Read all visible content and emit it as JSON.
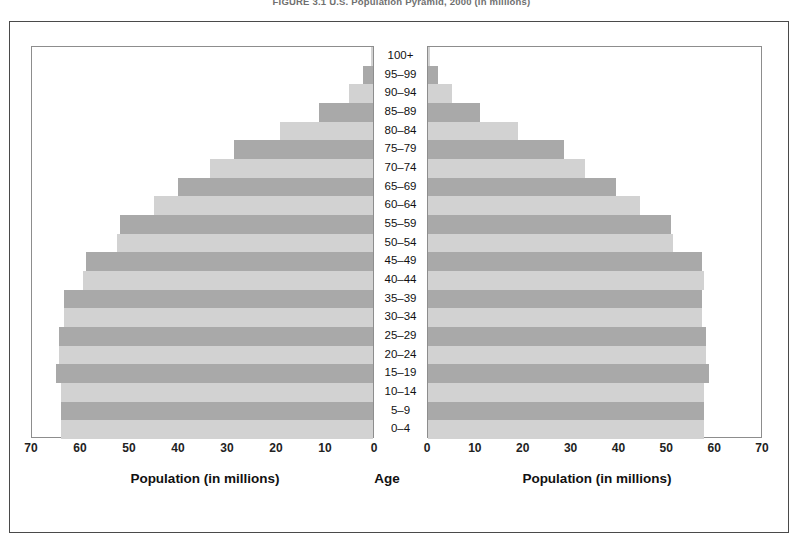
{
  "figure": {
    "caption": "FIGURE 3.1  U.S. Population Pyramid, 2000 (in millions)"
  },
  "labels": {
    "male": "Male",
    "female": "Female",
    "age_axis": "Age",
    "population_axis_left": "Population (in millions)",
    "population_axis_right": "Population (in millions)"
  },
  "colors": {
    "bar_dark": "#a9a9a9",
    "bar_light": "#d2d2d2",
    "frame": "#4a4a4a",
    "panel_border": "#8d8d8d",
    "text": "#111111"
  },
  "chart_data": {
    "type": "bar",
    "title": "FIGURE 3.1  U.S. Population Pyramid, 2000 (in millions)",
    "subtype": "population-pyramid",
    "orientation": "horizontal",
    "xlabel": "Population (in millions)",
    "ylabel": "Age",
    "xlim": [
      0,
      70
    ],
    "xticks": [
      0,
      10,
      20,
      30,
      40,
      50,
      60,
      70
    ],
    "xticklabels_left": [
      "70",
      "60",
      "50",
      "40",
      "30",
      "20",
      "10",
      "0"
    ],
    "xticklabels_right": [
      "0",
      "10",
      "20",
      "30",
      "40",
      "50",
      "60",
      "70"
    ],
    "grid": false,
    "legend": [
      "Male",
      "Female"
    ],
    "legend_position": "top-corners",
    "categories": [
      "100+",
      "95–99",
      "90–94",
      "85–89",
      "80–84",
      "75–79",
      "70–74",
      "65–69",
      "60–64",
      "55–59",
      "50–54",
      "45–49",
      "40–44",
      "35–39",
      "30–34",
      "25–29",
      "20–24",
      "15–19",
      "10–14",
      "5–9",
      "0–4"
    ],
    "series": [
      {
        "name": "Male",
        "side": "left",
        "values": [
          0.4,
          2.0,
          5.0,
          11.0,
          19.0,
          28.5,
          33.5,
          40.0,
          45.0,
          52.0,
          52.5,
          59.0,
          59.5,
          63.5,
          63.5,
          64.5,
          64.5,
          65.0,
          64.0,
          64.0,
          64.0
        ]
      },
      {
        "name": "Female",
        "side": "right",
        "values": [
          0.5,
          2.0,
          5.0,
          11.0,
          19.0,
          28.5,
          33.0,
          39.5,
          44.5,
          51.0,
          51.5,
          57.5,
          58.0,
          57.5,
          57.5,
          58.5,
          58.5,
          59.0,
          58.0,
          58.0,
          58.0
        ]
      }
    ],
    "shading_pattern": [
      "light",
      "dark"
    ],
    "shading_note": "Alternating light/dark grey bands; rows with dark fill: 95-99, 85-89, 75-79, 65-69, 55-59, 45-49, 35-39, 25-29, 15-19, 5-9"
  }
}
